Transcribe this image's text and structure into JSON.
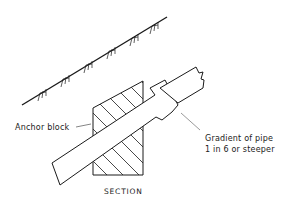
{
  "diagram": {
    "type": "engineering section drawing",
    "labels": {
      "anchor_block": "Anchor block",
      "gradient_line1": "Gradient of pipe",
      "gradient_line2": "1 in 6 or steeper",
      "caption": "SECTION"
    },
    "colors": {
      "line": "#1a1a1a",
      "background": "#ffffff"
    }
  }
}
